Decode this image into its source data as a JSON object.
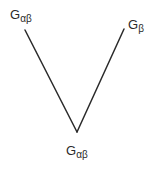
{
  "diagram": {
    "nodes": [
      {
        "id": "top_left",
        "main": "G",
        "sub": "αβ",
        "label": "Gαβ"
      },
      {
        "id": "top_right",
        "main": "G",
        "sub": "β",
        "label": "Gβ"
      },
      {
        "id": "bottom",
        "main": "G",
        "sub": "αβ",
        "label": "Gαβ"
      }
    ],
    "edges": [
      {
        "from": "top_left",
        "to": "bottom"
      },
      {
        "from": "top_right",
        "to": "bottom"
      }
    ],
    "line_color": "#2a2a2a"
  }
}
